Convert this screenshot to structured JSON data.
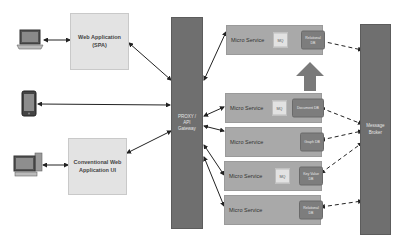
{
  "clients": [
    {
      "name": "laptop",
      "icon": "laptop-icon"
    },
    {
      "name": "mobile",
      "icon": "mobile-phone-icon"
    },
    {
      "name": "desktop",
      "icon": "desktop-computer-icon"
    }
  ],
  "apps": {
    "spa": {
      "line1": "Web Application",
      "line2": "(SPA)"
    },
    "conventional": {
      "line1": "Conventional Web",
      "line2": "Application UI"
    }
  },
  "gateway": {
    "line1": "PROXY /",
    "line2": "API",
    "line3": "Gateway"
  },
  "broker": {
    "line1": "Message",
    "line2": "Broker"
  },
  "services": [
    {
      "label": "Micro Service",
      "queue": "MQ",
      "db": "Relational DB"
    },
    {
      "label": "Micro Service",
      "queue": "MQ",
      "db": "Document DB"
    },
    {
      "label": "Micro Service",
      "queue": "",
      "db": "Graph DB"
    },
    {
      "label": "Micro Service",
      "queue": "MQ",
      "db": "Key Value DB"
    },
    {
      "label": "Micro Service",
      "queue": "",
      "db": "Relational DB"
    }
  ],
  "scale_arrow": {
    "label": "Scale"
  },
  "colors": {
    "app_box": "#e3e3e3",
    "service_box": "#a9a9a9",
    "gateway": "#6f6f6f",
    "db": "#7d7d7d",
    "arrow": "#222222"
  }
}
